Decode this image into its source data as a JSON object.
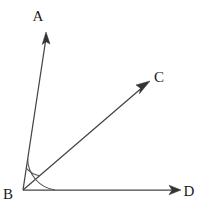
{
  "figure": {
    "background_color": "#ffffff",
    "line_color": "#444444",
    "arc_color": "#555555",
    "label_color": "#1a1a1a",
    "width": 202,
    "height": 206
  },
  "vertex": {
    "name": "B",
    "label": "B",
    "x": 23,
    "y": 190,
    "label_x": 4,
    "label_y": 198
  },
  "rays": [
    {
      "name": "ray-ba",
      "label": "A",
      "from_x": 23,
      "from_y": 190,
      "to_x": 46,
      "to_y": 33,
      "angle_degrees": 81.7,
      "label_x": 38,
      "label_y": 21,
      "arrow": "up-arrowhead"
    },
    {
      "name": "ray-bc",
      "label": "C",
      "from_x": 23,
      "from_y": 190,
      "to_x": 149,
      "to_y": 82,
      "angle_degrees": 40.6,
      "label_x": 154,
      "label_y": 82,
      "arrow": "up-right-arrowhead"
    },
    {
      "name": "ray-bd",
      "label": "D",
      "from_x": 23,
      "from_y": 190,
      "to_x": 180,
      "to_y": 190,
      "angle_degrees": 0,
      "label_x": 183,
      "label_y": 196,
      "arrow": "right-arrowhead"
    }
  ],
  "arcs": [
    {
      "name": "inner-arc-abc",
      "radius": 22,
      "start_angle_degrees": 81.7,
      "end_angle_degrees": 40.6,
      "spans": "A to C"
    },
    {
      "name": "outer-arc-abd",
      "radius": 32,
      "start_angle_degrees": 81.7,
      "end_angle_degrees": 0,
      "spans": "A to D"
    }
  ],
  "labels": {
    "a": "A",
    "b": "B",
    "c": "C",
    "d": "D"
  }
}
